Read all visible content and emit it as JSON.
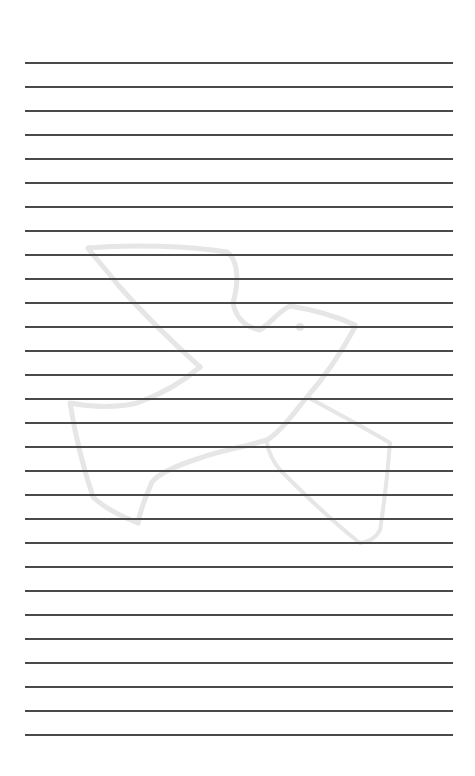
{
  "page": {
    "type": "lined-paper",
    "line_count": 29,
    "line_spacing_px": 24,
    "line_color": "#4a4a4a",
    "background_color": "#ffffff"
  },
  "watermark": {
    "icon": "dove-icon",
    "color": "#e6e6e6"
  }
}
